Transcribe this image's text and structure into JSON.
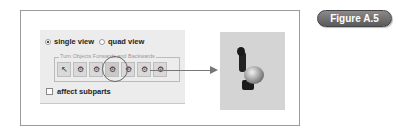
{
  "figure_label": "Figure A.5",
  "panel": {
    "view_options": [
      {
        "label": "single view",
        "selected": true
      },
      {
        "label": "quad view",
        "selected": false
      }
    ],
    "group_title": "Turn Objects Forwards and Backwards",
    "tool_icons": [
      {
        "name": "pointer-icon",
        "glyph": "↖"
      },
      {
        "name": "turn-tool-1-icon",
        "glyph": "⚙"
      },
      {
        "name": "turn-tool-2-icon",
        "glyph": "⚙"
      },
      {
        "name": "turn-tool-3-icon",
        "glyph": "⚙",
        "highlighted": true
      },
      {
        "name": "turn-tool-4-icon",
        "glyph": "⚙"
      },
      {
        "name": "turn-tool-5-icon",
        "glyph": "⚙"
      },
      {
        "name": "turn-tool-6-icon",
        "glyph": "⚙"
      }
    ],
    "affect_subparts": {
      "label": "affect subparts",
      "checked": false
    }
  },
  "preview": {
    "subject": "penguin model"
  }
}
